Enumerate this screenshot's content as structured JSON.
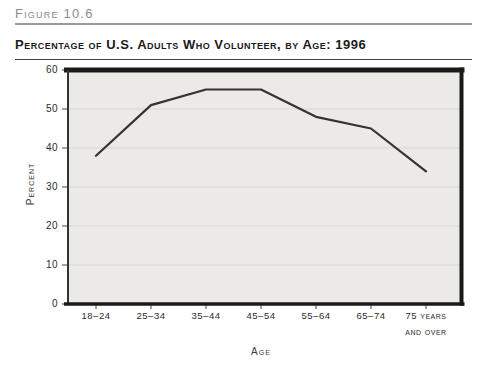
{
  "figure_label": "Figure 10.6",
  "title": "Percentage of U.S. Adults Who Volunteer, by Age: 1996",
  "chart_data": {
    "type": "line",
    "title": "Percentage of U.S. Adults Who Volunteer, by Age: 1996",
    "categories": [
      "18–24",
      "25–34",
      "35–44",
      "45–54",
      "55–64",
      "65–74",
      "75 years and over"
    ],
    "values": [
      38,
      51,
      55,
      55,
      48,
      45,
      34
    ],
    "xlabel": "Age",
    "ylabel": "Percent",
    "ylim": [
      0,
      60
    ],
    "yticks": [
      0,
      10,
      20,
      30,
      40,
      50,
      60
    ],
    "grid": true,
    "legend_position": "none",
    "colors": {
      "line": "#333333",
      "plot_bg": "#ebeae7",
      "gridline": "#d7d6d3",
      "frame": "#1a1a1a",
      "axis_text": "#2b2b2b",
      "figure_label": "#8c8c8c"
    }
  }
}
